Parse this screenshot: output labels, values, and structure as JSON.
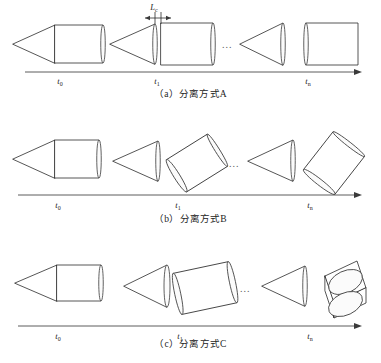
{
  "figure": {
    "axis_ticks": [
      {
        "id": "t0",
        "base": "t",
        "sub": "0"
      },
      {
        "id": "t1",
        "base": "t",
        "sub": "1"
      },
      {
        "id": "tn",
        "base": "t",
        "sub": "n"
      }
    ],
    "ellipsis": "...",
    "dimension_label": {
      "base": "L",
      "sub": "c"
    }
  },
  "panels": [
    {
      "id": "a",
      "caption": "（a）分离方式A",
      "mode_letter": "A",
      "tick_labels": [
        "t0",
        "t1",
        "tn"
      ],
      "description": "Axial separation: cone and cylinder part straight along the axis with gap L",
      "stages": [
        {
          "tick": "t0",
          "cone_angle_deg": 0,
          "cylinder_angle_deg": 0,
          "gap": 0
        },
        {
          "tick": "t1",
          "cone_angle_deg": 0,
          "cylinder_angle_deg": 0,
          "gap": 6
        },
        {
          "tick": "tn",
          "cone_angle_deg": 0,
          "cylinder_angle_deg": 0,
          "gap": 30
        }
      ],
      "has_dimension": true
    },
    {
      "id": "b",
      "caption": "（b）分离方式B",
      "mode_letter": "B",
      "tick_labels": [
        "t0",
        "t1",
        "tn"
      ],
      "description": "Tumbling separation: cylinder rotates progressively while moving away",
      "stages": [
        {
          "tick": "t0",
          "cone_angle_deg": 0,
          "cylinder_angle_deg": 0,
          "gap": 0
        },
        {
          "tick": "t1",
          "cone_angle_deg": 0,
          "cylinder_angle_deg": -32,
          "gap": 10
        },
        {
          "tick": "tn",
          "cone_angle_deg": 0,
          "cylinder_angle_deg": -52,
          "gap": 14
        }
      ],
      "has_dimension": false
    },
    {
      "id": "c",
      "caption": "（c）分离方式C",
      "mode_letter": "C",
      "tick_labels": [
        "t0",
        "t1",
        "tn"
      ],
      "description": "Cylinder rotates to near-vertical orientation by the final time step",
      "stages": [
        {
          "tick": "t0",
          "cone_angle_deg": 0,
          "cylinder_angle_deg": 0,
          "gap": 0
        },
        {
          "tick": "t1",
          "cone_angle_deg": 0,
          "cylinder_angle_deg": -12,
          "gap": 6
        },
        {
          "tick": "tn",
          "cone_angle_deg": 0,
          "cylinder_angle_deg": -78,
          "gap": 18
        }
      ],
      "has_dimension": false
    }
  ],
  "colors": {
    "stroke": "#2b2b2b",
    "axis": "#4a4a4a",
    "background": "#ffffff",
    "text": "#1d1d1d"
  }
}
